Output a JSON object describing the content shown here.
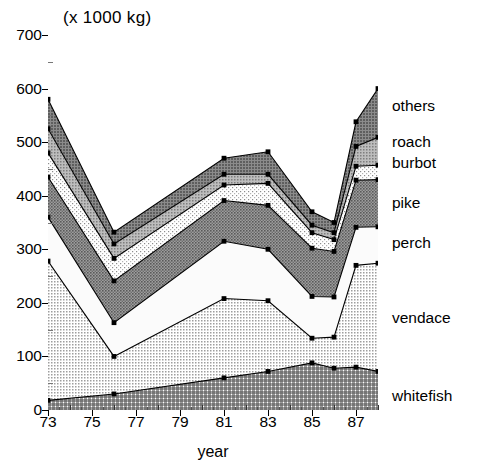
{
  "chart_data": {
    "type": "area",
    "title": "(x 1000 kg)",
    "xlabel": "year",
    "ylabel": "",
    "stacked": true,
    "grid": false,
    "legend_position": "right-outside",
    "xlim": [
      73,
      88
    ],
    "ylim": [
      0,
      700
    ],
    "ytick_labels": [
      "0",
      "100",
      "200",
      "300",
      "400",
      "500",
      "600",
      "700"
    ],
    "ytick_values": [
      0,
      100,
      200,
      300,
      400,
      500,
      600,
      700
    ],
    "xtick_labels": [
      "73",
      "75",
      "77",
      "79",
      "81",
      "83",
      "85",
      "87"
    ],
    "xtick_values": [
      73,
      75,
      77,
      79,
      81,
      83,
      85,
      87
    ],
    "xtick_minor_values": [
      74,
      76,
      78,
      80,
      82,
      84,
      86,
      88
    ],
    "x": [
      73,
      76,
      81,
      83,
      85,
      86,
      87,
      88
    ],
    "series": [
      {
        "name": "whitefish",
        "values": [
          18,
          30,
          60,
          72,
          88,
          78,
          80,
          72
        ],
        "pattern": "dense-crosshatch",
        "color": "#8f8f8f"
      },
      {
        "name": "vendace",
        "values": [
          260,
          70,
          148,
          132,
          46,
          58,
          190,
          202
        ],
        "pattern": "light-dots",
        "color": "#c9c9c9"
      },
      {
        "name": "perch",
        "values": [
          82,
          63,
          107,
          96,
          78,
          75,
          71,
          68
        ],
        "pattern": "white",
        "color": "#fbfbfb"
      },
      {
        "name": "pike",
        "values": [
          75,
          78,
          76,
          82,
          90,
          85,
          88,
          88
        ],
        "pattern": "dark-gray",
        "color": "#8a8a8a"
      },
      {
        "name": "burbot",
        "values": [
          45,
          42,
          29,
          41,
          29,
          22,
          26,
          27
        ],
        "pattern": "light-stipple",
        "color": "#dcdcdc"
      },
      {
        "name": "roach",
        "values": [
          45,
          27,
          20,
          17,
          14,
          13,
          37,
          52
        ],
        "pattern": "medium-gray",
        "color": "#a5a5a5"
      },
      {
        "name": "others",
        "values": [
          55,
          22,
          30,
          42,
          25,
          19,
          46,
          91
        ],
        "pattern": "dark-hatch",
        "color": "#7b7b7b"
      }
    ],
    "cumulative_tops": {
      "whitefish": [
        18,
        30,
        60,
        72,
        88,
        78,
        80,
        72
      ],
      "vendace": [
        278,
        100,
        208,
        204,
        134,
        136,
        270,
        274
      ],
      "perch": [
        360,
        163,
        315,
        300,
        212,
        211,
        341,
        342
      ],
      "pike": [
        435,
        241,
        391,
        382,
        302,
        296,
        429,
        430
      ],
      "burbot": [
        480,
        283,
        420,
        423,
        331,
        318,
        455,
        457
      ],
      "roach": [
        525,
        310,
        440,
        440,
        345,
        331,
        492,
        509
      ],
      "others": [
        580,
        332,
        470,
        482,
        370,
        350,
        538,
        600
      ]
    }
  },
  "legend": {
    "items": [
      {
        "label": "others"
      },
      {
        "label": "roach"
      },
      {
        "label": "burbot"
      },
      {
        "label": "pike"
      },
      {
        "label": "perch"
      },
      {
        "label": "vendace"
      },
      {
        "label": "whitefish"
      }
    ]
  }
}
